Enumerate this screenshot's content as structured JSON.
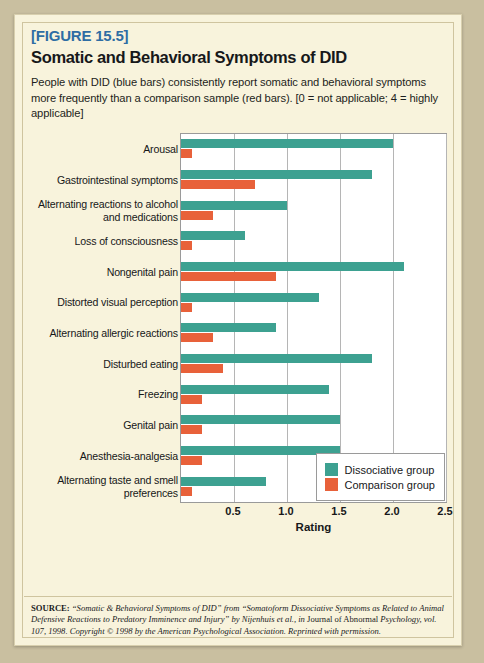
{
  "figure": {
    "label": "[FIGURE 15.5]",
    "title": "Somatic and Behavioral Symptoms of DID",
    "caption": "People with DID (blue bars) consistently report somatic and behavioral symptoms more frequently than a comparison sample (red bars). [0 = not applicable; 4 = highly applicable]",
    "source_head": "SOURCE:",
    "source_body": " “Somatic & Behavioral Symptoms of DID” from “Somatoform Dissociative Symptoms as Related to Animal Defensive Reactions to Predatory Imminence and Injury” by Nijenhuis et al., in ",
    "source_roman": "Journal of Abnormal",
    "source_body2": " Psychology, vol. 107, 1998. Copyright © 1998 by the American Psychological Association. Reprinted with permission."
  },
  "colors": {
    "dissociative": "#3da191",
    "comparison": "#e8613a",
    "card_background": "#f8f3dc",
    "page_background": "#c9bfa0",
    "label_blue": "#2e6da4",
    "plot_background": "#ffffff",
    "gridline": "#b5b5b5"
  },
  "chart_data": {
    "type": "bar",
    "orientation": "horizontal",
    "title": "Somatic and Behavioral Symptoms of DID",
    "xlabel": "Rating",
    "ylabel": "",
    "xlim": [
      0,
      2.5
    ],
    "xticks": [
      "0.5",
      "1.0",
      "1.5",
      "2.0",
      "2.5"
    ],
    "xtick_values": [
      0.5,
      1.0,
      1.5,
      2.0,
      2.5
    ],
    "grid": true,
    "legend_position": "bottom-right",
    "categories": [
      "Arousal",
      "Gastrointestinal symptoms",
      "Alternating reactions to alcohol and medications",
      "Loss of consciousness",
      "Nongenital pain",
      "Distorted visual perception",
      "Alternating allergic reactions",
      "Disturbed eating",
      "Freezing",
      "Genital pain",
      "Anesthesia-analgesia",
      "Alternating taste and smell preferences"
    ],
    "series": [
      {
        "name": "Dissociative group",
        "color": "#3da191",
        "values": [
          2.0,
          1.8,
          1.0,
          0.6,
          2.1,
          1.3,
          0.9,
          1.8,
          1.4,
          1.5,
          1.5,
          0.8
        ]
      },
      {
        "name": "Comparison group",
        "color": "#e8613a",
        "values": [
          0.1,
          0.7,
          0.3,
          0.1,
          0.9,
          0.1,
          0.3,
          0.4,
          0.2,
          0.2,
          0.2,
          0.1
        ]
      }
    ]
  }
}
